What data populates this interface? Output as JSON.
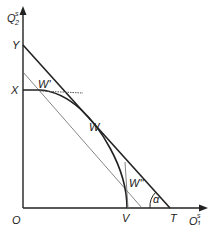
{
  "diagram": {
    "axes": {
      "y_label": "Q",
      "y_label_sub": "2",
      "y_label_sup": "s",
      "x_label": "Q",
      "x_label_sub": "1",
      "x_label_sup": "s",
      "origin_label": "O"
    },
    "points": {
      "Y": "Y",
      "X": "X",
      "W_prime": "W'",
      "W": "W",
      "W_double_prime": "W''",
      "V": "V",
      "T": "T"
    },
    "angle_label": "α",
    "colors": {
      "line": "#222222",
      "dotted": "#555555",
      "background": "#ffffff"
    }
  }
}
